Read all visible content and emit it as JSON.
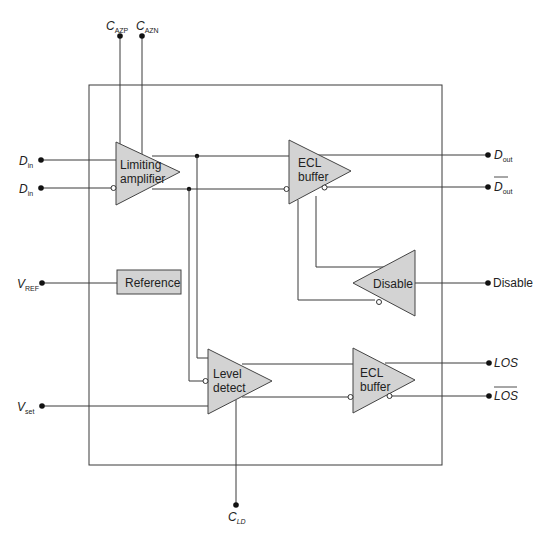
{
  "diagram": {
    "type": "block-diagram",
    "blocks": {
      "limiting_amplifier": {
        "line1": "Limiting",
        "line2": "amplifier"
      },
      "ecl_buffer_data": {
        "line1": "ECL",
        "line2": "buffer"
      },
      "disable": {
        "label": "Disable"
      },
      "reference": {
        "label": "Reference"
      },
      "level_detect": {
        "line1": "Level",
        "line2": "detect"
      },
      "ecl_buffer_los": {
        "line1": "ECL",
        "line2": "buffer"
      }
    },
    "pins": {
      "c_azp": {
        "main": "C",
        "sub": "AZP"
      },
      "c_azn": {
        "main": "C",
        "sub": "AZN"
      },
      "d_in_pos": {
        "main": "D",
        "sub": "in"
      },
      "d_in_neg": {
        "main": "D",
        "sub": "in"
      },
      "v_ref": {
        "main": "V",
        "sub": "REF"
      },
      "v_set": {
        "main": "V",
        "sub": "set"
      },
      "c_ld": {
        "main": "C",
        "sub": "LD"
      },
      "d_out": {
        "main": "D",
        "sub": "out"
      },
      "d_out_bar": {
        "main": "D",
        "sub": "out"
      },
      "disable_out": {
        "label": "Disable"
      },
      "los": {
        "label": "LOS"
      },
      "los_bar": {
        "label": "LOS"
      }
    },
    "colors": {
      "block_fill": "#d3d3d3",
      "wire": "#3a3a3a",
      "background": "#ffffff"
    }
  }
}
